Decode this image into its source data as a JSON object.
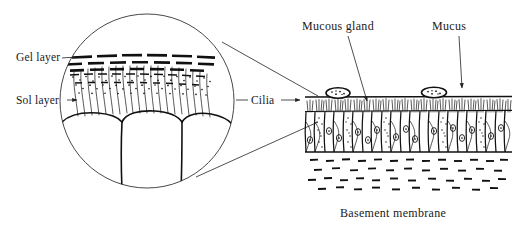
{
  "figure": {
    "background_color": "#ffffff",
    "ink_color": "#111111",
    "labels": {
      "gel_layer": "Gel layer",
      "sol_layer": "Sol layer",
      "cilia": "Cilia",
      "mucous_gland": "Mucous gland",
      "mucus": "Mucus",
      "basement_membrane": "Basement membrane"
    },
    "inset": {
      "shape": "circle",
      "center_x": 147,
      "center_y": 101,
      "radius": 88,
      "description": "Magnified view of the mucus blanket showing gel layer, sol layer and cilia"
    },
    "main_view": {
      "left": 305,
      "right": 512,
      "mucus_line_y": 97,
      "epithelium_top_y": 100,
      "epithelium_bottom_y": 152,
      "basement_zone_top_y": 156,
      "basement_zone_bottom_y": 196,
      "gland_count": 2,
      "cell_count": 22
    }
  }
}
